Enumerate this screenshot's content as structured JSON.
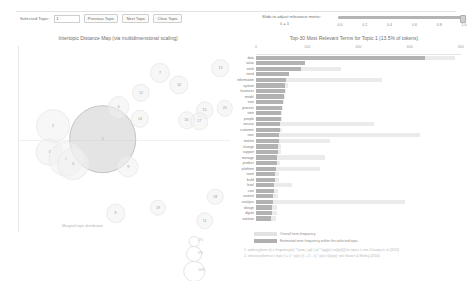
{
  "controls": {
    "selected_topic_label": "Selected Topic:",
    "topic_value": "1",
    "previous_topic_label": "Previous Topic",
    "next_topic_label": "Next Topic",
    "clear_topic_label": "Clear Topic"
  },
  "slider": {
    "label": "Slide to adjust relevance metric:",
    "lambda_label": "λ = 1",
    "value": 1,
    "min": 0,
    "max": 1,
    "ticks": [
      "0.0",
      "0.2",
      "0.4",
      "0.6",
      "0.8",
      "1.0"
    ]
  },
  "left_panel": {
    "title": "Intertopic Distance Map (via multidimensional scaling)",
    "marginal_note": "Marginal topic distribution",
    "size_legend": [
      {
        "label": "2%",
        "value": 2
      },
      {
        "label": "5%",
        "value": 5
      },
      {
        "label": "10%",
        "value": 10
      }
    ]
  },
  "right_panel": {
    "title": "Top-30 Most Relevant Terms for Topic 1 (13.5% of tokens)",
    "axis_ticks": [
      "0",
      "200",
      "400",
      "600",
      "800"
    ],
    "axis_max": 800
  },
  "legend": {
    "overall_label": "Overall term frequency",
    "topic_label": "Estimated term frequency within the selected topic",
    "footnote1": "1. saliency(term w) = frequency(w) * [sum_t p(t | w) * log(p(t | w)/p(t))] for topics t; see Chuang et. al (2012)",
    "footnote2": "2. relevance(term w | topic t) = λ * p(w | t) + (1 - λ) * p(w | t)/p(w); see Sievert & Shirley (2014)"
  },
  "colors": {
    "bar_topic": "#b2b2b2",
    "bar_overall": "#ebebeb",
    "bubble_selected": "#cdcdcd",
    "bubble_plain": "#f0f0f0",
    "text": "#707070"
  },
  "chart_data": [
    {
      "type": "scatter",
      "title": "Intertopic Distance Map (via multidimensional scaling)",
      "xlabel": "PC1",
      "ylabel": "PC2",
      "xlim": [
        -0.35,
        0.35
      ],
      "ylim": [
        -0.35,
        0.35
      ],
      "grid": false,
      "legend_position": "bottom-right",
      "points": [
        {
          "topic": 1,
          "x": 40.0,
          "y": 50.0,
          "size": 13.5,
          "selected": true
        },
        {
          "topic": 2,
          "x": 16.5,
          "y": 57.0,
          "size": 3.4,
          "selected": false
        },
        {
          "topic": 3,
          "x": 14.8,
          "y": 43.0,
          "size": 2.1,
          "selected": false
        },
        {
          "topic": 4,
          "x": 22.5,
          "y": 39.0,
          "size": 3.6,
          "selected": false
        },
        {
          "topic": 5,
          "x": 26.0,
          "y": 36.5,
          "size": 3.0,
          "selected": false
        },
        {
          "topic": 6,
          "x": 47.5,
          "y": 67.0,
          "size": 1.4,
          "selected": false
        },
        {
          "topic": 7,
          "x": 67.0,
          "y": 85.5,
          "size": 1.2,
          "selected": false
        },
        {
          "topic": 8,
          "x": 46.0,
          "y": 10.0,
          "size": 1.1,
          "selected": false
        },
        {
          "topic": 9,
          "x": 52.0,
          "y": 35.0,
          "size": 1.3,
          "selected": false
        },
        {
          "topic": 10,
          "x": 76.0,
          "y": 79.0,
          "size": 1.1,
          "selected": false
        },
        {
          "topic": 11,
          "x": 88.0,
          "y": 6.0,
          "size": 0.9,
          "selected": false
        },
        {
          "topic": 12,
          "x": 58.0,
          "y": 75.0,
          "size": 1.0,
          "selected": false
        },
        {
          "topic": 13,
          "x": 95.5,
          "y": 88.0,
          "size": 0.9,
          "selected": false
        },
        {
          "topic": 14,
          "x": 57.5,
          "y": 61.0,
          "size": 1.0,
          "selected": false
        },
        {
          "topic": 15,
          "x": 88.0,
          "y": 65.5,
          "size": 0.9,
          "selected": false
        },
        {
          "topic": 16,
          "x": 79.5,
          "y": 60.0,
          "size": 0.9,
          "selected": false
        },
        {
          "topic": 17,
          "x": 85.5,
          "y": 59.5,
          "size": 0.9,
          "selected": false
        },
        {
          "topic": 18,
          "x": 93.0,
          "y": 19.0,
          "size": 0.8,
          "selected": false
        },
        {
          "topic": 19,
          "x": 66.0,
          "y": 13.0,
          "size": 0.8,
          "selected": false
        },
        {
          "topic": 20,
          "x": 97.5,
          "y": 66.5,
          "size": 0.8,
          "selected": false
        }
      ]
    },
    {
      "type": "bar",
      "orientation": "horizontal",
      "title": "Top-30 Most Relevant Terms for Topic 1 (13.5% of tokens)",
      "xlabel": "",
      "ylabel": "",
      "xlim": [
        0,
        800
      ],
      "grid": false,
      "legend_position": "bottom",
      "categories": [
        "data",
        "value",
        "work",
        "need",
        "information",
        "system",
        "business",
        "model",
        "new",
        "process",
        "time",
        "people",
        "service",
        "customer",
        "user",
        "market",
        "change",
        "support",
        "manage",
        "product",
        "platform",
        "team",
        "build",
        "level",
        "cost",
        "content",
        "analysis",
        "design",
        "digital",
        "solution"
      ],
      "series": [
        {
          "name": "Overall term frequency",
          "values": [
            775,
            190,
            330,
            130,
            490,
            125,
            118,
            112,
            108,
            105,
            100,
            102,
            460,
            100,
            640,
            290,
            98,
            96,
            270,
            92,
            250,
            90,
            88,
            140,
            86,
            84,
            580,
            82,
            80,
            78
          ]
        },
        {
          "name": "Estimated term frequency within the selected topic",
          "values": [
            660,
            190,
            175,
            130,
            118,
            115,
            112,
            108,
            105,
            100,
            98,
            96,
            94,
            92,
            90,
            88,
            86,
            84,
            82,
            80,
            78,
            76,
            74,
            72,
            70,
            68,
            66,
            64,
            62,
            60
          ]
        }
      ]
    }
  ]
}
